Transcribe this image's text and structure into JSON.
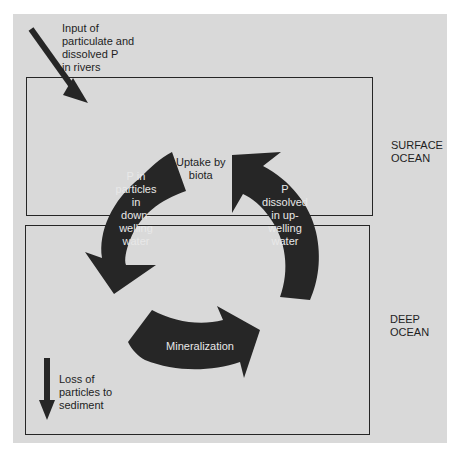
{
  "diagram": {
    "zones": {
      "surface": {
        "label": "SURFACE\nOCEAN"
      },
      "deep": {
        "label": "DEEP\nOCEAN"
      }
    },
    "labels": {
      "river_input": "Input of\nparticulate and\ndissolved P\nin rivers",
      "uptake": "Uptake by\nbiota",
      "downwelling": "P in\nparticles\nin\ndown-\nwelling\nwater",
      "upwelling": "P\ndissolved\nin up-\nwelling\nwater",
      "mineralization": "Mineralization",
      "sediment_loss": "Loss of\nparticles to\nsediment"
    },
    "colors": {
      "background": "#d9d9d9",
      "arrow": "#262626",
      "border": "#262626",
      "arrow_text": "#e8e8e8"
    }
  }
}
